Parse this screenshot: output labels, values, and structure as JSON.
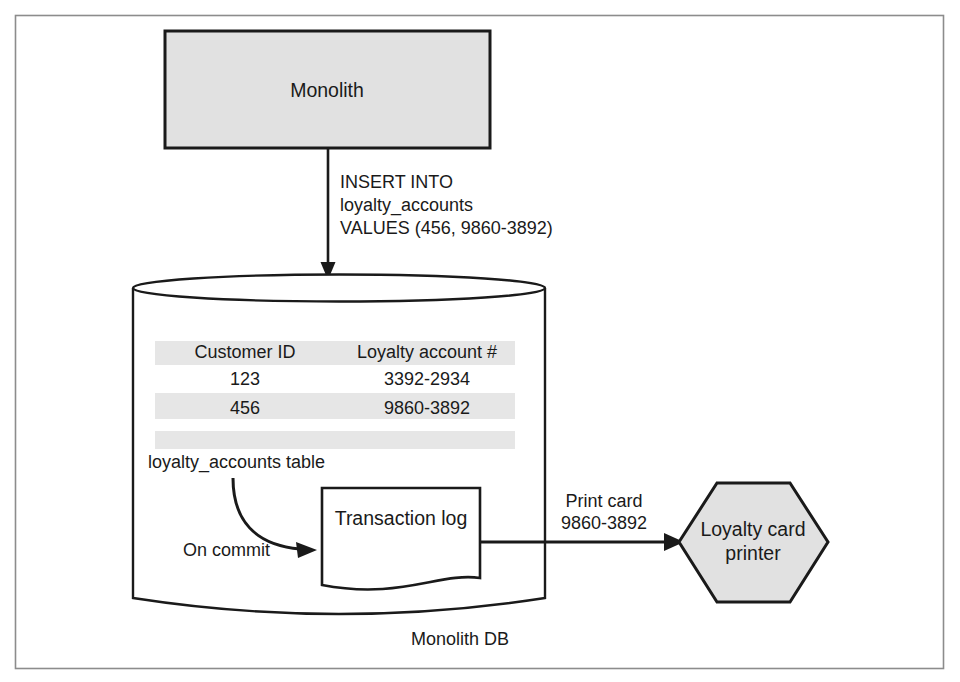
{
  "figure": {
    "frame_border_color": "#8c8c8c",
    "line_color": "#1a1a1a",
    "node_fill_gray": "#e1e1e1",
    "node_fill_white": "#ffffff",
    "table_band_fill": "#e6e6e6",
    "text_color": "#1a1a1a"
  },
  "nodes": {
    "monolith": {
      "label": "Monolith",
      "shape": "rectangle",
      "fill": "#e1e1e1"
    },
    "database": {
      "label": "Monolith DB",
      "shape": "cylinder",
      "fill": "#ffffff"
    },
    "transaction_log": {
      "label": "Transaction log",
      "shape": "document",
      "fill": "#ffffff"
    },
    "printer": {
      "label_line1": "Loyalty card",
      "label_line2": "printer",
      "shape": "hexagon",
      "fill": "#e1e1e1"
    }
  },
  "edges": {
    "insert": {
      "line1": "INSERT INTO",
      "line2": "loyalty_accounts",
      "line3": "VALUES (456, 9860-3892)"
    },
    "on_commit": {
      "label": "On commit"
    },
    "print_card": {
      "line1": "Print card",
      "line2": "9860-3892"
    }
  },
  "table": {
    "caption": "loyalty_accounts table",
    "headers": [
      "Customer ID",
      "Loyalty account  #"
    ],
    "rows": [
      [
        "123",
        "3392-2934"
      ],
      [
        "456",
        "9860-3892"
      ]
    ]
  }
}
